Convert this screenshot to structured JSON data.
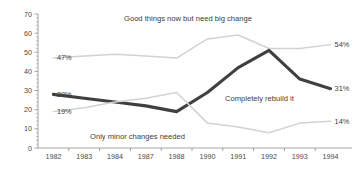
{
  "chart_data": {
    "type": "line",
    "title": "",
    "subtitle": "",
    "xlabel": "",
    "ylabel": "",
    "ylim": [
      0,
      70
    ],
    "ytick_step": 10,
    "yticks": [
      0,
      10,
      20,
      30,
      40,
      50,
      60,
      70
    ],
    "grid": false,
    "legend_position": "inline-annotations",
    "categories": [
      "1982",
      "1983",
      "1984",
      "1987",
      "1988",
      "1990",
      "1991",
      "1992",
      "1993",
      "1994"
    ],
    "series": [
      {
        "name": "Good things now but need big change",
        "style": "light",
        "values": [
          47,
          48,
          49,
          48,
          47,
          57,
          59,
          52,
          52,
          54
        ],
        "start_label": "47%",
        "end_label": "54%"
      },
      {
        "name": "Completely rebuild it",
        "style": "dark",
        "values": [
          28,
          26,
          24,
          22,
          19,
          29,
          42,
          51,
          36,
          31
        ],
        "start_label": "28%",
        "end_label": "31%"
      },
      {
        "name": "Only minor changes needed",
        "style": "light",
        "values": [
          19,
          21,
          24,
          26,
          29,
          13,
          11,
          8,
          13,
          14
        ],
        "start_label": "19%",
        "end_label": "14%"
      }
    ],
    "annotations": [
      {
        "text": "Good things now but need big change",
        "series": "Good things now but need big change"
      },
      {
        "text": "Completely rebuild it",
        "series": "Completely rebuild it"
      },
      {
        "text": "Only minor changes needed",
        "series": "Only minor changes needed"
      }
    ]
  }
}
